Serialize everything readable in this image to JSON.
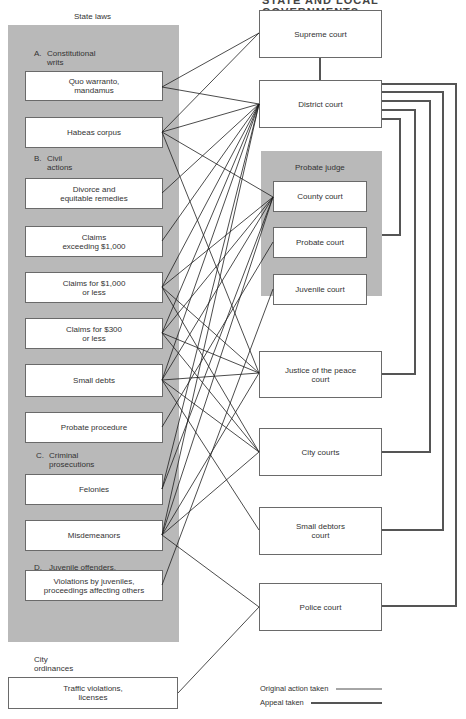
{
  "header": {
    "cut_title": "STATE AND LOCAL GOVERNMENTS"
  },
  "left": {
    "title": "State laws",
    "sections": [
      {
        "letter": "A.",
        "label": "Constitutional\nwrits"
      },
      {
        "letter": "B.",
        "label": "Civil\nactions"
      },
      {
        "letter": "C.",
        "label": "Criminal\nprosecutions"
      },
      {
        "letter": "D.",
        "label": "Juvenile offenders,\nDependent and\nneglected children"
      }
    ],
    "items": [
      "Quo warranto,\nmandamus",
      "Habeas corpus",
      "Divorce and\nequitable remedies",
      "Claims\nexceeding $1,000",
      "Claims for $1,000\nor less",
      "Claims for $300\nor less",
      "Small debts",
      "Probate procedure",
      "Felonies",
      "Misdemeanors",
      "Violations by juveniles,\nproceedings affecting others"
    ],
    "city": {
      "title": "City\nordinances",
      "item": "Traffic violations,\nlicenses"
    }
  },
  "right": {
    "supreme": "Supreme court",
    "district": "District court",
    "probate_group": {
      "title": "Probate judge",
      "items": [
        "County court",
        "Probate court",
        "Juvenile court"
      ]
    },
    "jp": "Justice of the peace\ncourt",
    "city": "City courts",
    "small_debtors": "Small debtors\ncourt",
    "police": "Police court"
  },
  "legend": {
    "original": "Original action taken",
    "appeal": "Appeal taken"
  },
  "colors": {
    "panel": "#b9b9b9",
    "line": "#1e1e1e",
    "appeal": "#555555"
  }
}
